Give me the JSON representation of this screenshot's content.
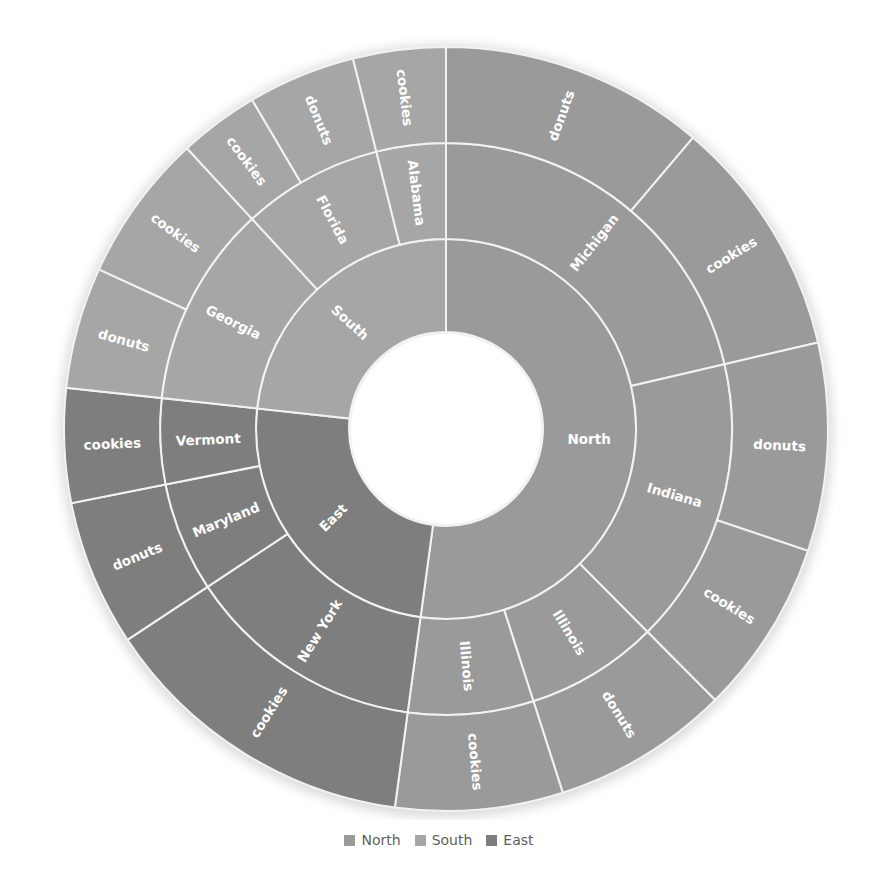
{
  "chart_data": {
    "type": "sunburst",
    "title": "",
    "legend": {
      "position": "bottom",
      "entries": [
        {
          "name": "North",
          "color": "#9a9a9a"
        },
        {
          "name": "South",
          "color": "#a6a6a6"
        },
        {
          "name": "East",
          "color": "#7e7e7e"
        }
      ]
    },
    "geometry": {
      "cx": 446,
      "cy": 429,
      "hole_radius": 97,
      "ring_radii": [
        190,
        286,
        382
      ],
      "start_angle_deg": 0,
      "direction": "clockwise"
    },
    "series": [
      {
        "name": "North",
        "color": "#9a9a9a",
        "children": [
          {
            "name": "Michigan",
            "children": [
              {
                "name": "donuts",
                "value": 40.3
              },
              {
                "name": "cookies",
                "value": 36.6
              }
            ]
          },
          {
            "name": "Indiana",
            "children": [
              {
                "name": "donuts",
                "value": 31.7
              },
              {
                "name": "cookies",
                "value": 26.6
              }
            ]
          },
          {
            "name": "Illinois",
            "children": [
              {
                "name": "donuts",
                "value": 27.0
              }
            ]
          },
          {
            "name": "Illinois",
            "children": [
              {
                "name": "cookies",
                "value": 25.5
              }
            ]
          }
        ]
      },
      {
        "name": "East",
        "color": "#7e7e7e",
        "children": [
          {
            "name": "New York",
            "children": [
              {
                "name": "cookies",
                "value": 48.8
              }
            ]
          },
          {
            "name": "Maryland",
            "children": [
              {
                "name": "donuts",
                "value": 22.3
              }
            ]
          },
          {
            "name": "Vermont",
            "children": [
              {
                "name": "cookies",
                "value": 17.4
              }
            ]
          }
        ]
      },
      {
        "name": "South",
        "color": "#a6a6a6",
        "children": [
          {
            "name": "Georgia",
            "children": [
              {
                "name": "donuts",
                "value": 18.5
              },
              {
                "name": "cookies",
                "value": 22.6
              }
            ]
          },
          {
            "name": "Florida",
            "children": [
              {
                "name": "cookies",
                "value": 12.2
              },
              {
                "name": "donuts",
                "value": 16.4
              }
            ]
          },
          {
            "name": "Alabama",
            "children": [
              {
                "name": "cookies",
                "value": 14.1
              }
            ]
          }
        ]
      }
    ]
  }
}
